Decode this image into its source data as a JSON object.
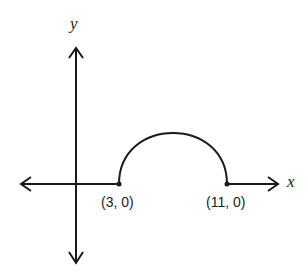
{
  "diagram": {
    "axes": {
      "x_label": "x",
      "y_label": "y"
    },
    "points": [
      {
        "label": "(3, 0)",
        "x": 3,
        "y": 0
      },
      {
        "label": "(11, 0)",
        "x": 11,
        "y": 0
      }
    ],
    "curve": {
      "type": "semicircle",
      "from": [
        3,
        0
      ],
      "to": [
        11,
        0
      ],
      "direction": "up"
    },
    "colors": {
      "stroke": "#1a1a1a",
      "background": "#ffffff"
    }
  }
}
